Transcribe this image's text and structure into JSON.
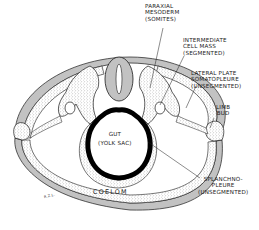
{
  "diagram": {
    "type": "embryo cross-section",
    "colors": {
      "ink": "#1a1a1a",
      "stipple_fill": "#e6e6e6",
      "background": "#ffffff",
      "gut_wall": "#000000"
    },
    "labels": {
      "paraxial_mesoderm": {
        "line1": "PARAXIAL",
        "line2": "MESODERM",
        "line3": "(SOMITES)"
      },
      "intermediate_cell_mass": {
        "line1": "INTERMEDIATE",
        "line2": "CELL MASS",
        "line3": "(SEGMENTED)"
      },
      "lateral_plate": {
        "line1": "LATERAL PLATE",
        "line2": "SOMATOPLEURE",
        "line3": "(UNSEGMENTED)"
      },
      "limb_bud": {
        "line1": "LIMB",
        "line2": "BUD"
      },
      "gut": {
        "line1": "GUT",
        "line2": "(YOLK SAC)"
      },
      "splanchnopleure": {
        "line1": "SPLANCHNO-",
        "line2": "PLEURE",
        "line3": "(UNSEGMENTED)"
      },
      "coelom": "COELOM",
      "signature": "R.Z.L."
    }
  }
}
